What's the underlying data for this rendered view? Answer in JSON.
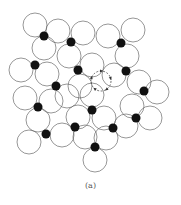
{
  "figure": {
    "caption": "(a)",
    "colors": {
      "stroke": "#6a6a6a",
      "dot": "#111111",
      "background": "#ffffff",
      "indicator": "#333333"
    },
    "circle_radius": 12,
    "dot_radius": 4.5,
    "dots": [
      [
        44,
        36
      ],
      [
        71,
        42
      ],
      [
        121,
        43
      ],
      [
        35,
        65
      ],
      [
        78,
        70
      ],
      [
        126,
        71
      ],
      [
        56,
        86
      ],
      [
        144,
        91
      ],
      [
        38,
        107
      ],
      [
        92,
        110
      ],
      [
        136,
        118
      ],
      [
        46,
        134
      ],
      [
        75,
        127
      ],
      [
        113,
        128
      ],
      [
        95,
        147
      ]
    ],
    "circles": [
      [
        35,
        25
      ],
      [
        58,
        31
      ],
      [
        83,
        33
      ],
      [
        108,
        36
      ],
      [
        133,
        30
      ],
      [
        44,
        48
      ],
      [
        69,
        56
      ],
      [
        127,
        56
      ],
      [
        21,
        70
      ],
      [
        47,
        74
      ],
      [
        92,
        65
      ],
      [
        114,
        75
      ],
      [
        139,
        82
      ],
      [
        67,
        96
      ],
      [
        80,
        86
      ],
      [
        157,
        92
      ],
      [
        25,
        98
      ],
      [
        51,
        101
      ],
      [
        92,
        95
      ],
      [
        132,
        106
      ],
      [
        38,
        120
      ],
      [
        78,
        117
      ],
      [
        104,
        118
      ],
      [
        150,
        118
      ],
      [
        29,
        142
      ],
      [
        62,
        135
      ],
      [
        85,
        137
      ],
      [
        106,
        138
      ],
      [
        126,
        126
      ],
      [
        95,
        160
      ]
    ],
    "rotation_indicator": {
      "center": [
        101,
        81
      ],
      "radius": 10,
      "arrows": 5
    }
  }
}
